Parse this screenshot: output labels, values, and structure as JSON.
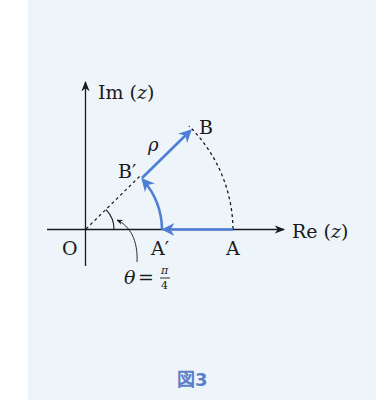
{
  "figure": {
    "caption": "図3",
    "colors": {
      "background": "#edf4fa",
      "axis": "#1a1a1a",
      "path": "#4f7fd4",
      "caption": "#5b80c8"
    },
    "axes": {
      "x_label": "Re (z)",
      "x_label_main": "Re",
      "y_label": "Im (z)",
      "y_label_main": "Im",
      "var": "z",
      "origin_label": "O"
    },
    "points": {
      "A": "A",
      "A_prime": "A′",
      "B": "B",
      "B_prime": "B′"
    },
    "annotations": {
      "rho": "ρ",
      "theta": "θ",
      "equals": "=",
      "pi": "π",
      "four": "4",
      "theta_text": "θ = π/4"
    }
  }
}
